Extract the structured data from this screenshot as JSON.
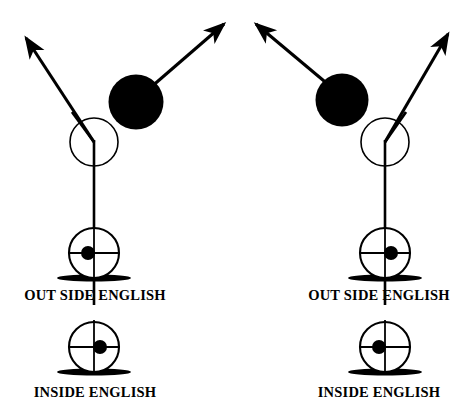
{
  "figure": {
    "background_color": "#ffffff",
    "stroke_color": "#000000",
    "object_ball_color": "#000000",
    "cue_ball_color": "#ffffff",
    "width": 474,
    "height": 420
  },
  "panels": [
    {
      "id": "left-panel",
      "name": "outside-english-panel",
      "cue_ball": {
        "cx": 94,
        "cy": 142,
        "r": 24
      },
      "object_ball": {
        "cx": 136,
        "cy": 102,
        "r": 27
      },
      "cue_stick": {
        "x1": 94,
        "y1": 300,
        "x2": 94,
        "y2": 142,
        "tip_x": 74,
        "tip_y": 118
      },
      "cue_ball_path": {
        "x1": 94,
        "y1": 142,
        "x2": 22,
        "y2": 32,
        "arrow": "up-left"
      },
      "object_ball_path": {
        "x1": 150,
        "y1": 86,
        "x2": 228,
        "y2": 18,
        "arrow": "up-right"
      },
      "top_ball_marker": {
        "cx": 94,
        "cy": 253,
        "r": 25,
        "spot_cx": 88,
        "spot_cy": 253,
        "spot_r": 7,
        "base_x": 58,
        "base_y": 277,
        "base_w": 73,
        "base_h": 6
      },
      "bottom_ball_marker": {
        "cx": 94,
        "cy": 347,
        "r": 25,
        "spot_cx": 100,
        "spot_cy": 347,
        "spot_r": 7,
        "base_x": 58,
        "base_y": 371,
        "base_w": 73,
        "base_h": 6
      },
      "top_label": "OUT SIDE ENGLISH",
      "bottom_label": "INSIDE ENGLISH"
    },
    {
      "id": "right-panel",
      "name": "inside-english-panel",
      "cue_ball": {
        "cx": 385,
        "cy": 142,
        "r": 24
      },
      "object_ball": {
        "cx": 342,
        "cy": 100,
        "r": 26
      },
      "cue_stick": {
        "x1": 385,
        "y1": 300,
        "x2": 385,
        "y2": 142,
        "tip_x": 404,
        "tip_y": 118
      },
      "cue_ball_path": {
        "x1": 385,
        "y1": 142,
        "x2": 252,
        "y2": 18,
        "arrow": "up-left"
      },
      "object_ball_path": {
        "x1": 400,
        "y1": 118,
        "x2": 452,
        "y2": 28,
        "arrow": "up-right"
      },
      "top_ball_marker": {
        "cx": 385,
        "cy": 253,
        "r": 25,
        "spot_cx": 391,
        "spot_cy": 253,
        "spot_r": 7,
        "base_x": 349,
        "base_y": 277,
        "base_w": 73,
        "base_h": 6
      },
      "bottom_ball_marker": {
        "cx": 385,
        "cy": 347,
        "r": 25,
        "spot_cx": 379,
        "spot_cy": 347,
        "spot_r": 7,
        "base_x": 349,
        "base_y": 371,
        "base_w": 73,
        "base_h": 6
      },
      "top_label": "OUT SIDE ENGLISH",
      "bottom_label": "INSIDE ENGLISH"
    }
  ]
}
